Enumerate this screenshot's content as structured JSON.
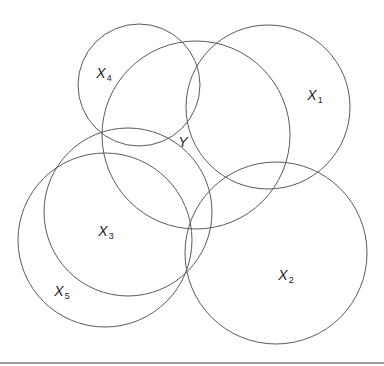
{
  "diagram": {
    "type": "overlapping-circles",
    "stroke_color": "#5a5a5a",
    "circles": [
      {
        "id": "X4",
        "cx": 139,
        "cy": 85,
        "r": 61
      },
      {
        "id": "Y",
        "cx": 196,
        "cy": 135,
        "r": 94
      },
      {
        "id": "X1",
        "cx": 268,
        "cy": 107,
        "r": 82
      },
      {
        "id": "X3",
        "cx": 128,
        "cy": 212,
        "r": 84
      },
      {
        "id": "X5",
        "cx": 105,
        "cy": 240,
        "r": 87
      },
      {
        "id": "X2",
        "cx": 276,
        "cy": 253,
        "r": 91
      }
    ],
    "labels": [
      {
        "id": "X4",
        "main": "X",
        "sub": "4",
        "x": 104,
        "y": 74
      },
      {
        "id": "Y",
        "main": "Y",
        "sub": "",
        "x": 183,
        "y": 142
      },
      {
        "id": "X1",
        "main": "X",
        "sub": "1",
        "x": 315,
        "y": 96
      },
      {
        "id": "X3",
        "main": "X",
        "sub": "3",
        "x": 106,
        "y": 232
      },
      {
        "id": "X5",
        "main": "X",
        "sub": "5",
        "x": 62,
        "y": 292
      },
      {
        "id": "X2",
        "main": "X",
        "sub": "2",
        "x": 286,
        "y": 276
      }
    ]
  }
}
